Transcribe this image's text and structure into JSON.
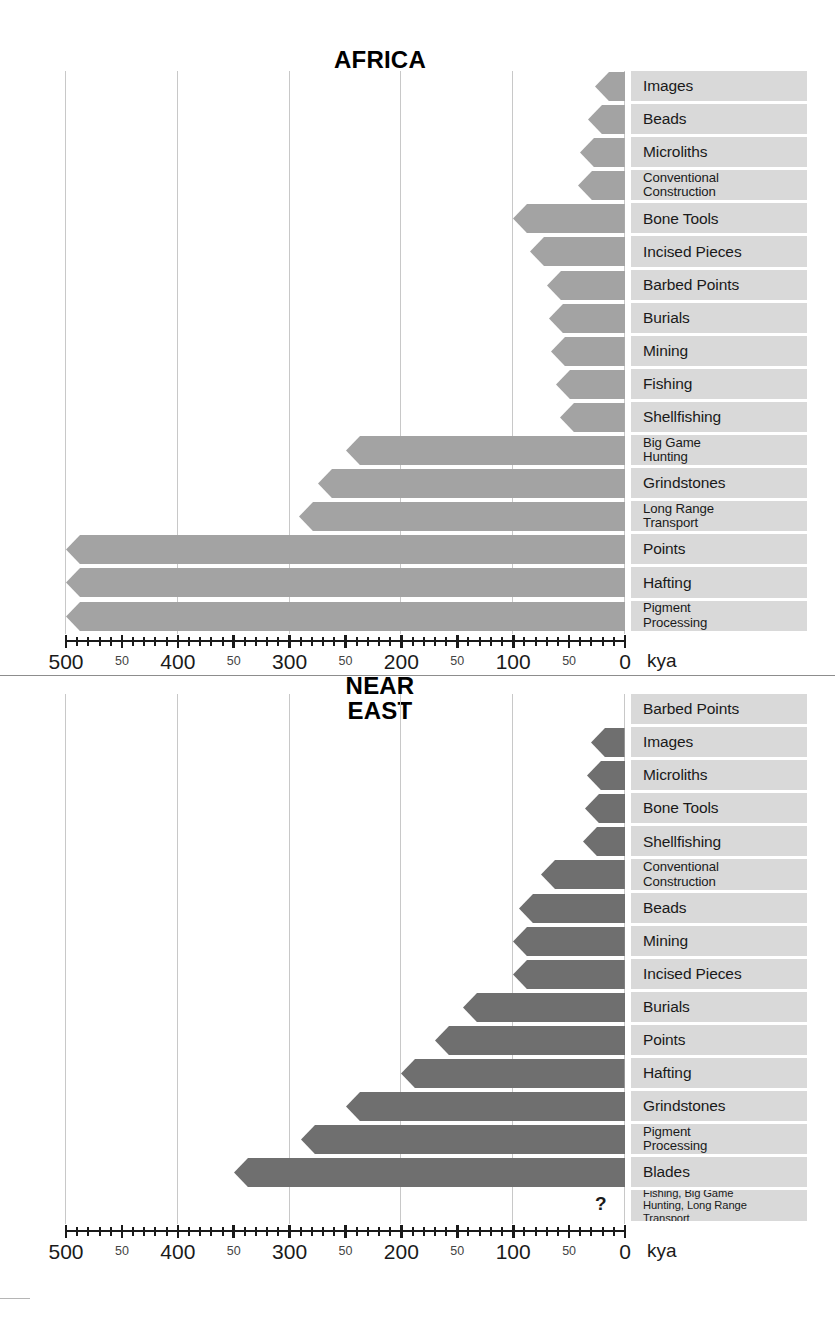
{
  "figure": {
    "axis_unit": "kya",
    "axis_max": 500,
    "axis_min": 0,
    "major_ticks": [
      "500",
      "400",
      "300",
      "200",
      "100",
      "0"
    ],
    "minor_tick_label": "50",
    "colors": {
      "africa_bar": "#a3a3a3",
      "neareast_bar": "#6f6f6f",
      "label_strip": "#d9d9d9",
      "gridline": "#c8c8c8",
      "axis": "#1a1a1a"
    },
    "unknown_marker": "?"
  },
  "chart_data": [
    {
      "type": "bar",
      "orientation": "horizontal",
      "title": "AFRICA",
      "xlabel": "kya",
      "ylabel": "",
      "xlim": [
        500,
        0
      ],
      "axis_reversed": true,
      "grid": true,
      "legend": "none",
      "categories": [
        "Images",
        "Beads",
        "Microliths",
        "Conventional\nConstruction",
        "Bone Tools",
        "Incised Pieces",
        "Barbed Points",
        "Burials",
        "Mining",
        "Fishing",
        "Shellfishing",
        "Big Game\nHunting",
        "Grindstones",
        "Long Range\nTransport",
        "Points",
        "Hafting",
        "Pigment\nProcessing"
      ],
      "values": [
        27,
        33,
        40,
        42,
        100,
        85,
        70,
        68,
        66,
        62,
        58,
        250,
        275,
        292,
        500,
        500,
        500
      ]
    },
    {
      "type": "bar",
      "orientation": "horizontal",
      "title": "NEAR\nEAST",
      "xlabel": "kya",
      "ylabel": "",
      "xlim": [
        500,
        0
      ],
      "axis_reversed": true,
      "grid": true,
      "legend": "none",
      "categories": [
        "Barbed Points",
        "Images",
        "Microliths",
        "Bone Tools",
        "Shellfishing",
        "Conventional\nConstruction",
        "Beads",
        "Mining",
        "Incised Pieces",
        "Burials",
        "Points",
        "Hafting",
        "Grindstones",
        "Pigment\nProcessing",
        "Blades",
        "Fishing, Big Game\nHunting, Long Range\nTransport"
      ],
      "values": [
        0,
        30,
        34,
        36,
        38,
        75,
        95,
        100,
        100,
        145,
        170,
        200,
        250,
        290,
        350,
        null
      ]
    }
  ]
}
